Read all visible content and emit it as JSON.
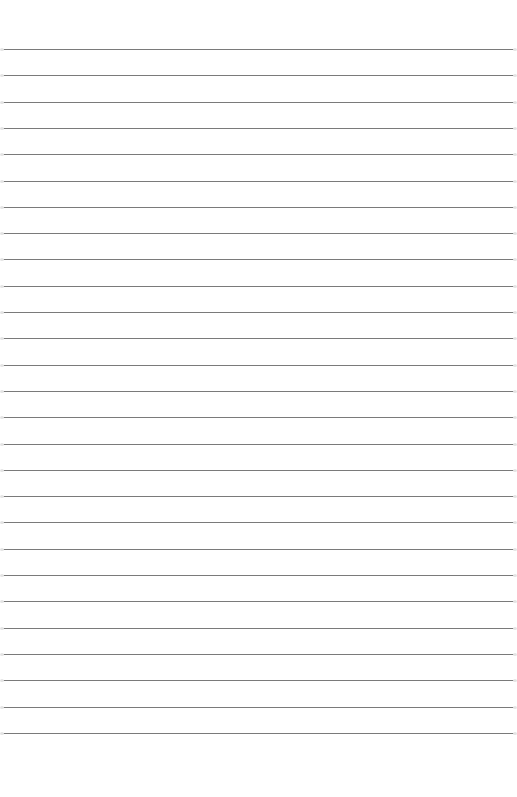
{
  "page": {
    "type": "lined-paper",
    "background": "#ffffff",
    "line_color": "#7a7a7a",
    "line_count": 27,
    "first_line_y": 49,
    "line_spacing": 26.3
  }
}
